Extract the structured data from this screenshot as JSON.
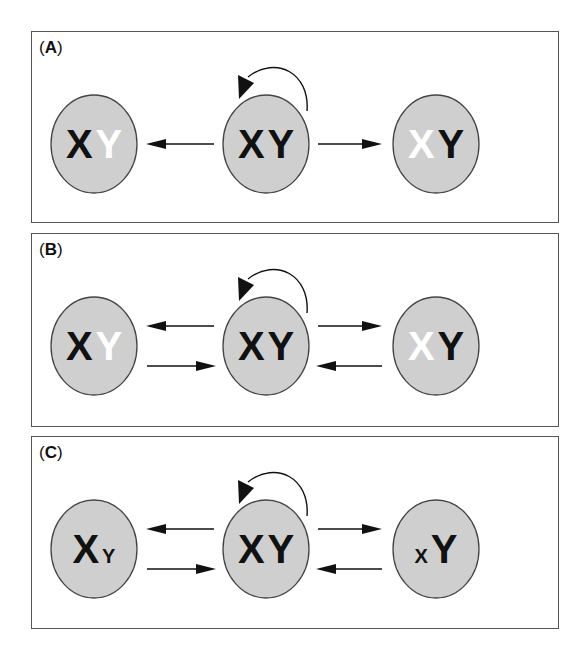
{
  "figure": {
    "panels": [
      {
        "label": "A",
        "top": 31,
        "height": 192,
        "cells": [
          {
            "position": "left",
            "x_label": "X",
            "y_label": "Y",
            "x_color": "#111111",
            "y_color": "#ffffff",
            "x_size": 40,
            "y_size": 40
          },
          {
            "position": "center",
            "x_label": "X",
            "y_label": "Y",
            "x_color": "#111111",
            "y_color": "#111111",
            "x_size": 40,
            "y_size": 40
          },
          {
            "position": "right",
            "x_label": "X",
            "y_label": "Y",
            "x_color": "#ffffff",
            "y_color": "#111111",
            "x_size": 40,
            "y_size": 40
          }
        ],
        "arrows": {
          "self_renewal": true,
          "center_to_left": true,
          "center_to_right": true,
          "left_to_center": false,
          "right_to_center": false
        }
      },
      {
        "label": "B",
        "top": 233,
        "height": 194,
        "cells": [
          {
            "position": "left",
            "x_label": "X",
            "y_label": "Y",
            "x_color": "#111111",
            "y_color": "#ffffff",
            "x_size": 40,
            "y_size": 40
          },
          {
            "position": "center",
            "x_label": "X",
            "y_label": "Y",
            "x_color": "#111111",
            "y_color": "#111111",
            "x_size": 40,
            "y_size": 40
          },
          {
            "position": "right",
            "x_label": "X",
            "y_label": "Y",
            "x_color": "#ffffff",
            "y_color": "#111111",
            "x_size": 40,
            "y_size": 40
          }
        ],
        "arrows": {
          "self_renewal": true,
          "center_to_left": true,
          "center_to_right": true,
          "left_to_center": true,
          "right_to_center": true
        }
      },
      {
        "label": "C",
        "top": 436,
        "height": 193,
        "cells": [
          {
            "position": "left",
            "x_label": "X",
            "y_label": "Y",
            "x_color": "#111111",
            "y_color": "#111111",
            "x_size": 40,
            "y_size": 20
          },
          {
            "position": "center",
            "x_label": "X",
            "y_label": "Y",
            "x_color": "#111111",
            "y_color": "#111111",
            "x_size": 40,
            "y_size": 40
          },
          {
            "position": "right",
            "x_label": "X",
            "y_label": "Y",
            "x_color": "#111111",
            "y_color": "#111111",
            "x_size": 20,
            "y_size": 40
          }
        ],
        "arrows": {
          "self_renewal": true,
          "center_to_left": true,
          "center_to_right": true,
          "left_to_center": true,
          "right_to_center": true
        }
      }
    ],
    "colors": {
      "cell_fill": "#cfcfcf",
      "cell_stroke": "#444444",
      "arrow": "#111111",
      "border": "#555555"
    }
  }
}
